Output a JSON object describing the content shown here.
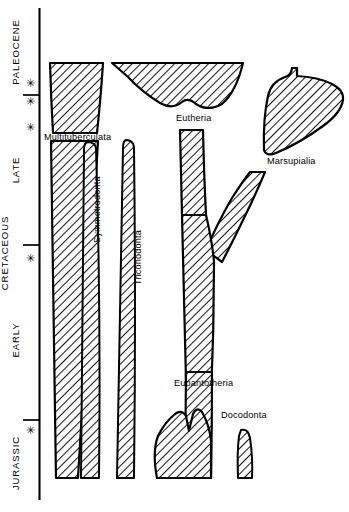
{
  "figure": {
    "background_color": "#ffffff",
    "ink_color": "#000000"
  },
  "time_axis": {
    "name": "geologic-time-axis",
    "periods": [
      {
        "id": "paleocene",
        "label": "PALEOCENE",
        "y_top": 8,
        "y_bottom": 95
      },
      {
        "id": "late",
        "label": "LATE",
        "y_top": 95,
        "y_bottom": 245
      },
      {
        "id": "early",
        "label": "EARLY",
        "y_top": 245,
        "y_bottom": 420
      },
      {
        "id": "jurassic",
        "label": "JURASSIC",
        "y_top": 420,
        "y_bottom": 500
      }
    ],
    "super_period": {
      "id": "cretaceous",
      "label": "CRETACEOUS",
      "y_top": 95,
      "y_bottom": 420
    },
    "boundary_ticks_y": [
      95,
      245,
      420
    ],
    "asterisk_glyph": "✳",
    "asterisks_y": [
      83,
      101,
      127,
      258,
      430
    ]
  },
  "taxa": [
    {
      "id": "multituberculata",
      "label": "Multituberculata",
      "label_x": 44,
      "label_y": 140
    },
    {
      "id": "symmetrodonta",
      "label": "Symmetrodonta",
      "label_x": 100,
      "label_y": 243,
      "orientation": "vertical"
    },
    {
      "id": "triconodonta",
      "label": "Triconodonta",
      "label_x": 141,
      "label_y": 282,
      "orientation": "vertical"
    },
    {
      "id": "eutheria",
      "label": "Eutheria",
      "label_x": 176,
      "label_y": 120
    },
    {
      "id": "marsupialia",
      "label": "Marsupialia",
      "label_x": 268,
      "label_y": 163
    },
    {
      "id": "eupantotheria",
      "label": "Eupantotheria",
      "label_x": 174,
      "label_y": 385
    },
    {
      "id": "docodonta",
      "label": "Docodonta",
      "label_x": 222,
      "label_y": 417
    }
  ]
}
